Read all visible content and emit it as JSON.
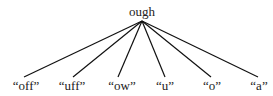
{
  "tree": {
    "root": {
      "label": "ough",
      "x": 142,
      "y": 12,
      "anchor_y": 21
    },
    "leaves": [
      {
        "label": "“off”",
        "x": 26,
        "line_x": 24
      },
      {
        "label": "“uff”",
        "x": 72,
        "line_x": 73
      },
      {
        "label": "“ow”",
        "x": 122,
        "line_x": 118
      },
      {
        "label": "“u”",
        "x": 165,
        "line_x": 165
      },
      {
        "label": "“o”",
        "x": 212,
        "line_x": 211
      },
      {
        "label": "“a”",
        "x": 259,
        "line_x": 258
      }
    ],
    "leaf_line_y": 77,
    "leaf_label_y": 79,
    "edge_color": "#111111"
  }
}
